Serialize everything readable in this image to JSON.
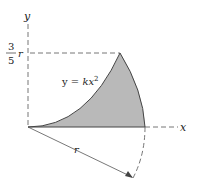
{
  "figure": {
    "axis_labels": {
      "x": "x",
      "y": "y"
    },
    "height_label": {
      "numerator": "3",
      "denominator": "5",
      "variable": "r"
    },
    "curve_label": {
      "prefix": "y = ",
      "coef": "k",
      "var": "x",
      "exp": "2"
    },
    "radius_label": "r",
    "colors": {
      "shade": "#b9b9b9",
      "stroke": "#444444",
      "dash": "#555555"
    }
  }
}
